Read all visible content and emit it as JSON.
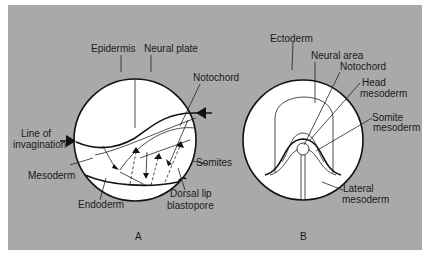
{
  "figure": {
    "panels": [
      {
        "id": "A",
        "caption": "A",
        "labels": {
          "epidermis": "Epidermis",
          "neural_plate": "Neural plate",
          "notochord": "Notochord",
          "line_of_invagination_1": "Line of",
          "line_of_invagination_2": "invagination",
          "somites": "Somites",
          "mesoderm": "Mesoderm",
          "endoderm": "Endoderm",
          "dorsal_lip_1": "Dorsal lip",
          "dorsal_lip_2": "blastopore"
        }
      },
      {
        "id": "B",
        "caption": "B",
        "labels": {
          "ectoderm": "Ectoderm",
          "neural_area": "Neural area",
          "notochord": "Notochord",
          "head_mesoderm_1": "Head",
          "head_mesoderm_2": "mesoderm",
          "somite_mesoderm_1": "Somite",
          "somite_mesoderm_2": "mesoderm",
          "lateral_mesoderm_1": "Lateral",
          "lateral_mesoderm_2": "mesoderm"
        }
      }
    ],
    "colors": {
      "background": "#a9a9a9",
      "embryo_fill": "#ffffff",
      "line": "#111111"
    }
  }
}
